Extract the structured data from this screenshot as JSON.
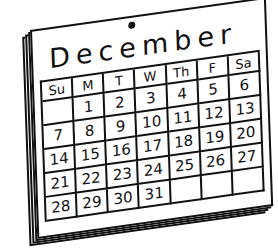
{
  "calendar": {
    "month": "December",
    "weekdays": [
      "Su",
      "M",
      "T",
      "W",
      "Th",
      "F",
      "Sa"
    ],
    "weeks": [
      [
        "",
        "1",
        "2",
        "3",
        "4",
        "5",
        "6"
      ],
      [
        "7",
        "8",
        "9",
        "10",
        "11",
        "12",
        "13"
      ],
      [
        "14",
        "15",
        "16",
        "17",
        "18",
        "19",
        "20"
      ],
      [
        "21",
        "22",
        "23",
        "24",
        "25",
        "26",
        "27"
      ],
      [
        "28",
        "29",
        "30",
        "31",
        "",
        "",
        ""
      ]
    ],
    "icons": [
      "hanging-hole-icon",
      "page-stack"
    ],
    "ink_color": "#111111",
    "paper_color": "#ffffff"
  }
}
